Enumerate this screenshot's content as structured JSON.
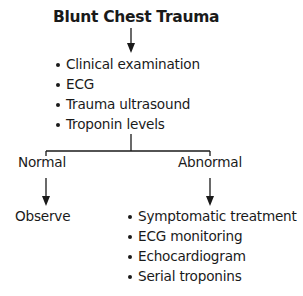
{
  "diagram": {
    "title": "Blunt Chest Trauma",
    "initial_steps": [
      "Clinical examination",
      "ECG",
      "Trauma ultrasound",
      "Troponin levels"
    ],
    "branches": {
      "normal": {
        "label": "Normal",
        "outcome": "Observe"
      },
      "abnormal": {
        "label": "Abnormal",
        "actions": [
          "Symptomatic treatment",
          "ECG monitoring",
          "Echocardiogram",
          "Serial troponins"
        ]
      }
    },
    "colors": {
      "text": "#1a1a1a",
      "lines": "#1a1a1a",
      "background": "#ffffff"
    }
  }
}
